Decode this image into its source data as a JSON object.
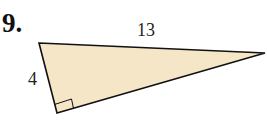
{
  "problem": {
    "number": "9."
  },
  "triangle": {
    "vertices": {
      "top_left": [
        39,
        43
      ],
      "right": [
        265,
        53
      ],
      "bottom_right_angle": [
        57,
        113
      ]
    },
    "fill_color": "#F5E6C8",
    "stroke_color": "#111111",
    "right_angle_at": "bottom_right_angle",
    "labels": {
      "hypotenuse": "13",
      "leg": "4"
    }
  }
}
